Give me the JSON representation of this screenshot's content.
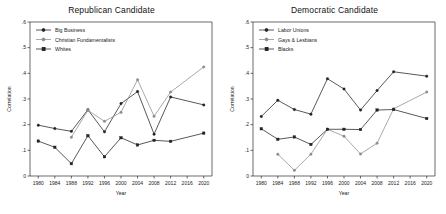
{
  "figure": {
    "background": "#ffffff",
    "axis_color": "#2b2b2b"
  },
  "chart_data": [
    {
      "type": "line",
      "title": "Republican Candidate",
      "xlabel": "Year",
      "ylabel": "Correlation",
      "x": [
        1980,
        1984,
        1988,
        1992,
        1996,
        2000,
        2004,
        2008,
        2012,
        2016,
        2020
      ],
      "xlim": [
        1978,
        2022
      ],
      "ylim": [
        0,
        0.6
      ],
      "yticks": [
        0,
        0.1,
        0.2,
        0.3,
        0.4,
        0.5,
        0.6
      ],
      "ytick_labels": [
        "0",
        ".1",
        ".2",
        ".3",
        ".4",
        ".5",
        ".6"
      ],
      "xtick_labels": [
        "1980",
        "1984",
        "1988",
        "1992",
        "1996",
        "2000",
        "2004",
        "2008",
        "2012",
        "2016",
        "2020"
      ],
      "grid": false,
      "legend_position": "upper left",
      "series": [
        {
          "name": "Big Business",
          "color": "#222222",
          "marker": "circle",
          "values": [
            0.198,
            0.185,
            0.174,
            0.258,
            0.172,
            0.282,
            0.329,
            0.163,
            0.308,
            null,
            0.277
          ]
        },
        {
          "name": "Christian Fundamentalists",
          "color": "#8c8c8c",
          "marker": "circle",
          "values": [
            null,
            null,
            0.151,
            0.256,
            0.213,
            0.248,
            0.375,
            0.233,
            0.327,
            null,
            0.425
          ]
        },
        {
          "name": "Whites",
          "color": "#222222",
          "marker": "square",
          "values": [
            0.136,
            0.112,
            0.048,
            0.157,
            0.075,
            0.149,
            0.121,
            0.139,
            0.135,
            null,
            0.167
          ]
        }
      ]
    },
    {
      "type": "line",
      "title": "Democratic Candidate",
      "xlabel": "Year",
      "ylabel": "Correlation",
      "x": [
        1980,
        1984,
        1988,
        1992,
        1996,
        2000,
        2004,
        2008,
        2012,
        2016,
        2020
      ],
      "xlim": [
        1978,
        2022
      ],
      "ylim": [
        0,
        0.6
      ],
      "yticks": [
        0,
        0.1,
        0.2,
        0.3,
        0.4,
        0.5,
        0.6
      ],
      "ytick_labels": [
        "0",
        ".1",
        ".2",
        ".3",
        ".4",
        ".5",
        ".6"
      ],
      "xtick_labels": [
        "1980",
        "1984",
        "1988",
        "1992",
        "1996",
        "2000",
        "2004",
        "2008",
        "2012",
        "2016",
        "2020"
      ],
      "grid": false,
      "legend_position": "upper left",
      "series": [
        {
          "name": "Labor Unions",
          "color": "#222222",
          "marker": "circle",
          "values": [
            0.232,
            0.295,
            0.259,
            0.241,
            0.379,
            0.339,
            0.257,
            0.333,
            0.406,
            null,
            0.389
          ]
        },
        {
          "name": "Gays & Lesbians",
          "color": "#8c8c8c",
          "marker": "circle",
          "values": [
            null,
            0.085,
            0.022,
            0.085,
            0.182,
            0.155,
            0.086,
            0.128,
            0.262,
            null,
            0.327
          ]
        },
        {
          "name": "Blacks",
          "color": "#222222",
          "marker": "square",
          "values": [
            0.184,
            0.143,
            0.152,
            0.123,
            0.182,
            0.182,
            0.181,
            0.257,
            0.259,
            null,
            0.224
          ]
        }
      ]
    }
  ]
}
